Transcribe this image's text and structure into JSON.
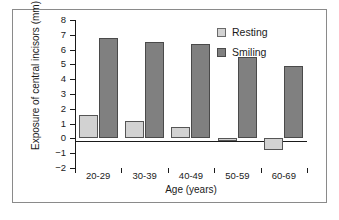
{
  "chart_data": {
    "type": "bar",
    "title": "",
    "xlabel": "Age (years)",
    "ylabel": "Exposure of central incisors (mm)",
    "categories": [
      "20-29",
      "30-39",
      "40-49",
      "50-59",
      "60-69"
    ],
    "series": [
      {
        "name": "Resting",
        "values": [
          1.6,
          1.2,
          0.8,
          -0.2,
          -0.8
        ],
        "color": "#d2d2d2"
      },
      {
        "name": "Smiling",
        "values": [
          6.8,
          6.5,
          6.35,
          5.5,
          4.9
        ],
        "color": "#808080"
      }
    ],
    "ylim": [
      -2,
      8
    ],
    "yticks": [
      8,
      7,
      6,
      5,
      4,
      3,
      2,
      1,
      0,
      -1,
      -2
    ],
    "ytick_labels": [
      "8",
      "7",
      "6",
      "5",
      "4",
      "3",
      "2",
      "1",
      "0",
      "−1",
      "−2"
    ],
    "grid": false,
    "legend_position": "top-right"
  },
  "legend": {
    "entries": [
      {
        "label": "Resting"
      },
      {
        "label": "Smiling"
      }
    ]
  }
}
